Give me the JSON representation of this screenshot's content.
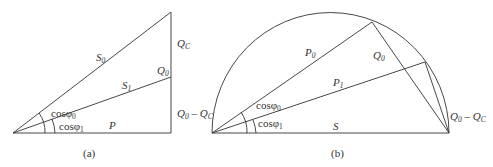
{
  "panels": [
    {
      "id": "a",
      "caption": "(a)",
      "labels": {
        "S0": "S",
        "S0_sub": "0",
        "S1": "S",
        "S1_sub": "1",
        "Q0": "Q",
        "Q0_sub": "0",
        "QC": "Q",
        "QC_sub": "C",
        "P": "P",
        "cos0": "cosφ",
        "cos0_sub": "0",
        "cos1": "cosφ",
        "cos1_sub": "1"
      }
    },
    {
      "id": "b",
      "caption": "(b)",
      "labels": {
        "P0": "P",
        "P0_sub": "0",
        "P1": "P",
        "P1_sub": "1",
        "Q0": "Q",
        "Q0_sub": "0",
        "S": "S",
        "Q0QC_left": "Q",
        "Q0QC_left_sub": "0",
        "Q0QC_left_mid": " – Q",
        "Q0QC_left_sub2": "C",
        "Q0QC_right": "Q",
        "Q0QC_right_sub": "0",
        "Q0QC_right_mid": " – Q",
        "Q0QC_right_sub2": "C",
        "cos0": "cosφ",
        "cos0_sub": "0",
        "cos1": "cosφ",
        "cos1_sub": "1"
      }
    }
  ]
}
